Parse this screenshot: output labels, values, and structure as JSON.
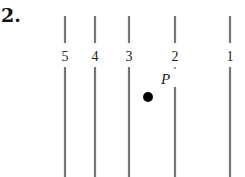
{
  "problem": {
    "number": "2."
  },
  "diagram": {
    "line_color": "#777777",
    "lines": [
      {
        "label": "5",
        "x": 65
      },
      {
        "label": "4",
        "x": 95
      },
      {
        "label": "3",
        "x": 129
      },
      {
        "label": "2",
        "x": 175
      },
      {
        "label": "1",
        "x": 230
      }
    ],
    "point": {
      "label": "P",
      "x": 148,
      "y": 97
    }
  }
}
